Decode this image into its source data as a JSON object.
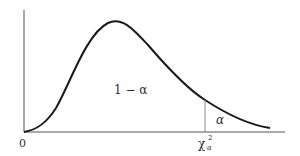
{
  "diagram": {
    "labels": {
      "origin": "0",
      "central_area": "1 − α",
      "tail_area": "α",
      "critical_value_base": "χ",
      "critical_value_sup": "2",
      "critical_value_sub": "α"
    },
    "colors": {
      "curve": "#1a1a1a",
      "axis": "#555555",
      "critical_line": "#888888",
      "text": "#333333",
      "background": "#ffffff"
    }
  }
}
